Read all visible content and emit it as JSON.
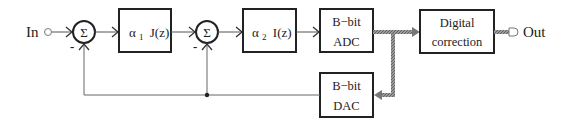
{
  "diagram": {
    "input_label": "In",
    "output_label": "Out",
    "summers": [
      {
        "id": "sum1",
        "symbol": "Σ",
        "minus_label": "-"
      },
      {
        "id": "sum2",
        "symbol": "Σ",
        "minus_label": "-"
      }
    ],
    "blocks": [
      {
        "id": "block-alpha1",
        "coef": "α",
        "sub": "1",
        "func": "J(z)"
      },
      {
        "id": "block-alpha2",
        "coef": "α",
        "sub": "2",
        "func": "I(z)"
      },
      {
        "id": "block-adc",
        "line1": "B−bit",
        "line2": "ADC"
      },
      {
        "id": "block-dac",
        "line1": "B−bit",
        "line2": "DAC"
      },
      {
        "id": "block-digital-correction",
        "line1": "Digital",
        "line2": "correction"
      }
    ],
    "colors": {
      "stroke": "#222222",
      "bus": "#7a7a7a",
      "thin_line": "#666666"
    }
  }
}
